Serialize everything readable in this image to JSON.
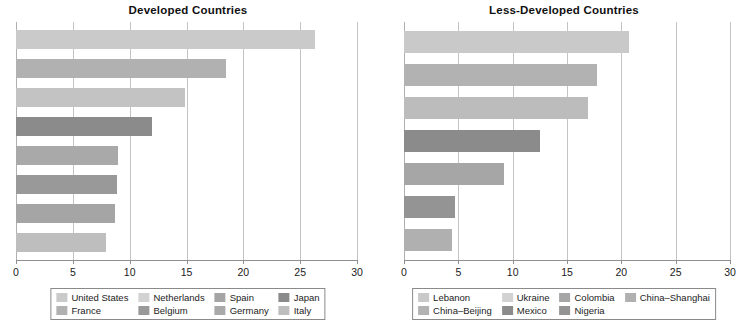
{
  "chart_data": [
    {
      "type": "bar",
      "orientation": "horizontal",
      "title": "Developed Countries",
      "xlabel": "",
      "ylabel": "",
      "xlim": [
        0,
        30
      ],
      "xticks": [
        0,
        5,
        10,
        15,
        20,
        25,
        30
      ],
      "xticklabels": [
        "0",
        "5",
        "10",
        "15",
        "20",
        "25",
        "30"
      ],
      "grid": true,
      "legend_position": "below",
      "categories": [
        "United States",
        "France",
        "Netherlands",
        "Belgium",
        "Spain",
        "Germany",
        "Japan",
        "Italy"
      ],
      "bar_order": [
        "United States",
        "France",
        "Netherlands",
        "Japan",
        "Germany",
        "Belgium",
        "Spain",
        "Italy"
      ],
      "values": [
        26.3,
        18.5,
        14.9,
        12.0,
        9.0,
        8.9,
        8.7,
        7.9
      ],
      "bars": [
        {
          "label": "United States",
          "value": 26.3,
          "color": "#cacaca"
        },
        {
          "label": "France",
          "value": 18.5,
          "color": "#b1b1b1"
        },
        {
          "label": "Netherlands",
          "value": 14.9,
          "color": "#c3c3c3"
        },
        {
          "label": "Japan",
          "value": 12.0,
          "color": "#8b8b8b"
        },
        {
          "label": "Germany",
          "value": 9.0,
          "color": "#a9a9a9"
        },
        {
          "label": "Belgium",
          "value": 8.9,
          "color": "#999999"
        },
        {
          "label": "Spain",
          "value": 8.7,
          "color": "#a5a5a5"
        },
        {
          "label": "Italy",
          "value": 7.9,
          "color": "#bebebe"
        }
      ],
      "legend": [
        {
          "label": "United States",
          "color": "#cacaca"
        },
        {
          "label": "Netherlands",
          "color": "#d2d2d2"
        },
        {
          "label": "Spain",
          "color": "#a5a5a5"
        },
        {
          "label": "Japan",
          "color": "#8b8b8b"
        },
        {
          "label": "France",
          "color": "#b1b1b1"
        },
        {
          "label": "Belgium",
          "color": "#999999"
        },
        {
          "label": "Germany",
          "color": "#a9a9a9"
        },
        {
          "label": "Italy",
          "color": "#bebebe"
        }
      ]
    },
    {
      "type": "bar",
      "orientation": "horizontal",
      "title": "Less-Developed Countries",
      "xlabel": "",
      "ylabel": "",
      "xlim": [
        0,
        30
      ],
      "xticks": [
        0,
        5,
        10,
        15,
        20,
        25,
        30
      ],
      "xticklabels": [
        "0",
        "5",
        "10",
        "15",
        "20",
        "25",
        "30"
      ],
      "grid": true,
      "legend_position": "below",
      "categories": [
        "Lebanon",
        "China–Beijing",
        "Ukraine",
        "Mexico",
        "Colombia",
        "Nigeria",
        "China–Shanghai"
      ],
      "bar_order": [
        "Lebanon",
        "China–Beijing",
        "Ukraine",
        "Mexico",
        "Colombia",
        "Nigeria",
        "China–Shanghai"
      ],
      "values": [
        20.7,
        17.8,
        16.9,
        12.5,
        9.2,
        4.7,
        4.4
      ],
      "bars": [
        {
          "label": "Lebanon",
          "value": 20.7,
          "color": "#c9c9c9"
        },
        {
          "label": "China–Beijing",
          "value": 17.8,
          "color": "#b2b2b2"
        },
        {
          "label": "Ukraine",
          "value": 16.9,
          "color": "#bcbcbc"
        },
        {
          "label": "Mexico",
          "value": 12.5,
          "color": "#8b8b8b"
        },
        {
          "label": "Colombia",
          "value": 9.2,
          "color": "#a6a6a6"
        },
        {
          "label": "Nigeria",
          "value": 4.7,
          "color": "#949494"
        },
        {
          "label": "China–Shanghai",
          "value": 4.4,
          "color": "#b0b0b0"
        }
      ],
      "legend": [
        {
          "label": "Lebanon",
          "color": "#c9c9c9"
        },
        {
          "label": "Ukraine",
          "color": "#d2d2d2"
        },
        {
          "label": "Colombia",
          "color": "#a6a6a6"
        },
        {
          "label": "China–Shanghai",
          "color": "#b0b0b0"
        },
        {
          "label": "China–Beijing",
          "color": "#b2b2b2"
        },
        {
          "label": "Mexico",
          "color": "#8b8b8b"
        },
        {
          "label": "Nigeria",
          "color": "#949494"
        }
      ]
    }
  ]
}
